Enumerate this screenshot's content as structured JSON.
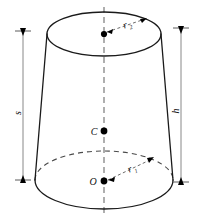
{
  "figure": {
    "background_color": "#ffffff",
    "line_color": "#1a1a1a",
    "hidden_line_color": "#4a4a4a",
    "axis_color": "#6d6d6d",
    "dimension_color": "#7a7a7a"
  },
  "labels": {
    "slant_height": "s",
    "height": "h",
    "top_radius": "r",
    "top_radius_subscript": "2",
    "bottom_radius": "r",
    "bottom_radius_subscript": "1",
    "center_point": "C",
    "origin_point": "O"
  },
  "shape": {
    "type": "frustum",
    "top_ellipse": {
      "cx": 104,
      "cy": 34,
      "rx": 57,
      "ry": 22
    },
    "bottom_ellipse": {
      "cx": 104,
      "cy": 180,
      "rx": 69,
      "ry": 29
    },
    "left_edge": {
      "x1": 47,
      "y1": 34,
      "x2": 35,
      "y2": 180
    },
    "right_edge": {
      "x1": 161,
      "y1": 34,
      "x2": 173,
      "y2": 180
    },
    "axis": {
      "x": 104,
      "y1": 7,
      "y2": 213
    }
  },
  "dimensions": {
    "slant": {
      "x": 23,
      "y1": 33,
      "y2": 178,
      "label_y": 110
    },
    "height": {
      "x": 181,
      "y1": 30,
      "y2": 180,
      "label_y": 108
    }
  },
  "points": {
    "top_center": {
      "x": 104,
      "y": 34
    },
    "mid_center": {
      "x": 104,
      "y": 131
    },
    "bottom_center": {
      "x": 104,
      "y": 181
    }
  }
}
